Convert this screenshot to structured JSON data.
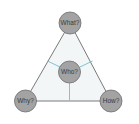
{
  "diagram": {
    "type": "triangle-with-center",
    "colors": {
      "triangle_fill": "#f3f6f7",
      "triangle_stroke": "#6b6b6b",
      "spoke_color": "#7ec4d6",
      "node_fill": "#a3a3a3",
      "node_stroke": "#6f6f6f",
      "label_color": "#3a3a3a"
    },
    "nodes": [
      {
        "id": "what",
        "label": "What?",
        "position": "top"
      },
      {
        "id": "who",
        "label": "Who?",
        "position": "center"
      },
      {
        "id": "why",
        "label": "Why?",
        "position": "bottom-left"
      },
      {
        "id": "how",
        "label": "How?",
        "position": "bottom-right"
      }
    ],
    "edges": [
      {
        "from": "what",
        "to": "why",
        "style": "triangle-side"
      },
      {
        "from": "what",
        "to": "how",
        "style": "triangle-side"
      },
      {
        "from": "why",
        "to": "how",
        "style": "triangle-side"
      },
      {
        "from": "who",
        "to": "left-side",
        "style": "spoke"
      },
      {
        "from": "who",
        "to": "right-side",
        "style": "spoke"
      },
      {
        "from": "who",
        "to": "bottom-side",
        "style": "spoke"
      }
    ]
  }
}
